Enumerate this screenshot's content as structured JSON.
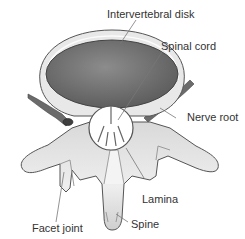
{
  "diagram": {
    "labels": {
      "disk": "Intervertebral disk",
      "cord": "Spinal cord",
      "nerve": "Nerve root",
      "lamina": "Lamina",
      "facet": "Facet joint",
      "spine": "Spine"
    },
    "colors": {
      "bone_light": "#f2f2f2",
      "bone_shade": "#b8b8b8",
      "outline": "#555555",
      "disk_ring": "#e6e6e6",
      "nucleus": "#7a7a7a",
      "nerve": "#6b6b6b",
      "canal": "#ffffff",
      "leader": "#777777"
    }
  }
}
